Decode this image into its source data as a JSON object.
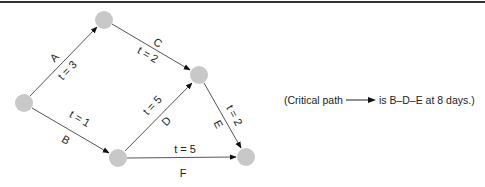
{
  "diagram": {
    "title": "",
    "nodes": [
      {
        "id": "start",
        "x": 24,
        "y": 103
      },
      {
        "id": "n_top",
        "x": 104,
        "y": 20
      },
      {
        "id": "n_mid",
        "x": 199,
        "y": 75
      },
      {
        "id": "n_bot",
        "x": 118,
        "y": 158
      },
      {
        "id": "end",
        "x": 246,
        "y": 157
      }
    ],
    "edges": [
      {
        "name": "A",
        "from": "start",
        "to": "n_top",
        "duration_label": "t = 3",
        "t": 3
      },
      {
        "name": "B",
        "from": "start",
        "to": "n_bot",
        "duration_label": "t = 1",
        "t": 1
      },
      {
        "name": "C",
        "from": "n_top",
        "to": "n_mid",
        "duration_label": "t = 2",
        "t": 2
      },
      {
        "name": "D",
        "from": "n_bot",
        "to": "n_mid",
        "duration_label": "t = 5",
        "t": 5
      },
      {
        "name": "E",
        "from": "n_mid",
        "to": "end",
        "duration_label": "t = 2",
        "t": 2
      },
      {
        "name": "F",
        "from": "n_bot",
        "to": "end",
        "duration_label": "t = 5",
        "t": 5
      }
    ],
    "note": {
      "prefix": "(Critical path",
      "suffix": "is B–D–E at 8 days.)"
    },
    "colors": {
      "node_fill": "#c8c8c8",
      "edge_stroke": "#555555",
      "text": "#222222"
    }
  }
}
